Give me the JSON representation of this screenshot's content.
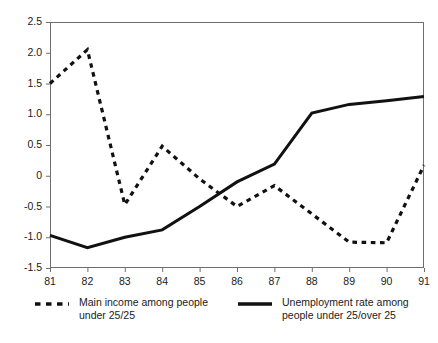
{
  "chart_data": {
    "type": "line",
    "title": "",
    "xlabel": "",
    "ylabel": "",
    "x": [
      81,
      82,
      83,
      84,
      85,
      86,
      87,
      88,
      89,
      90,
      91
    ],
    "xtick_labels": [
      "81",
      "82",
      "83",
      "84",
      "85",
      "86",
      "87",
      "88",
      "89",
      "90",
      "91"
    ],
    "ytick_labels": [
      "2.5",
      "2.0",
      "1.5",
      "1.0",
      "0.5",
      "0",
      "-0.5",
      "-1.0",
      "-1.5"
    ],
    "ytick_values": [
      2.5,
      2.0,
      1.5,
      1.0,
      0.5,
      0,
      -0.5,
      -1.0,
      -1.5
    ],
    "xlim": [
      81,
      91
    ],
    "ylim": [
      -1.5,
      2.5
    ],
    "grid": false,
    "legend_position": "bottom",
    "series": [
      {
        "name": "Main income among people\nunder 25/25",
        "style": "dashed",
        "color": "#111111",
        "values": [
          1.5,
          2.05,
          -0.47,
          0.48,
          -0.05,
          -0.5,
          -0.16,
          -0.62,
          -1.08,
          -1.09,
          0.17
        ]
      },
      {
        "name": "Unemployment rate among\npeople under 25/over 25",
        "style": "solid",
        "color": "#111111",
        "values": [
          -0.97,
          -1.17,
          -1.0,
          -0.88,
          -0.5,
          -0.1,
          0.19,
          1.02,
          1.16,
          1.22,
          1.29
        ]
      }
    ]
  },
  "legend": {
    "entries": [
      {
        "label": "Main income among people\nunder 25/25",
        "style": "dashed"
      },
      {
        "label": "Unemployment rate among\npeople under 25/over 25",
        "style": "solid"
      }
    ]
  },
  "axes": {
    "frame_color": "#6e6e6e",
    "tick_color": "#6e6e6e"
  }
}
